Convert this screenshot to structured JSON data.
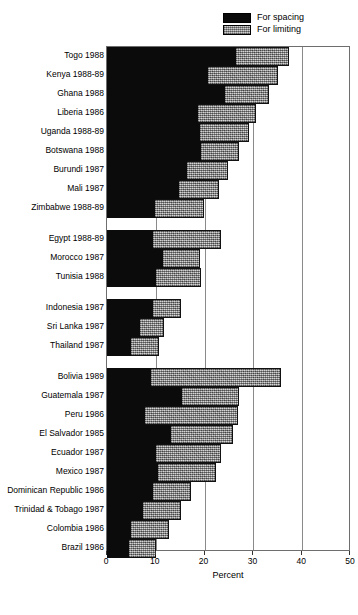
{
  "legend": {
    "items": [
      {
        "label": "For spacing",
        "swatch": "black",
        "color": "#0b0b0b"
      },
      {
        "label": "For limiting",
        "swatch": "gray",
        "color": "#a6a6a6"
      }
    ]
  },
  "axis": {
    "title": "Percent",
    "ticks": [
      0,
      10,
      20,
      30,
      40,
      50
    ],
    "tick_labels": [
      "0",
      "10",
      "20",
      "30",
      "40",
      "50"
    ]
  },
  "chart_data": {
    "type": "bar",
    "orientation": "horizontal",
    "stacked": true,
    "title": "",
    "xlabel": "Percent",
    "ylabel": "",
    "xlim": [
      0,
      50
    ],
    "grid": true,
    "legend_position": "top-right",
    "series": [
      {
        "name": "For spacing",
        "color": "#0b0b0b"
      },
      {
        "name": "For limiting",
        "color": "#a6a6a6"
      }
    ],
    "groups": [
      {
        "name": "Sub-Saharan Africa",
        "rows": [
          {
            "category": "Togo 1988",
            "spacing": 26.5,
            "limiting": 10.8,
            "total": 37.3
          },
          {
            "category": "Kenya 1988-89",
            "spacing": 20.7,
            "limiting": 14.3,
            "total": 35.0
          },
          {
            "category": "Ghana 1988",
            "spacing": 24.2,
            "limiting": 9.0,
            "total": 33.2
          },
          {
            "category": "Liberia 1986",
            "spacing": 18.6,
            "limiting": 11.9,
            "total": 30.5
          },
          {
            "category": "Uganda 1988-89",
            "spacing": 19.1,
            "limiting": 10.0,
            "total": 29.1
          },
          {
            "category": "Botswana 1988",
            "spacing": 19.3,
            "limiting": 7.8,
            "total": 27.1
          },
          {
            "category": "Burundi 1987",
            "spacing": 16.4,
            "limiting": 8.4,
            "total": 24.8
          },
          {
            "category": "Mali 1987",
            "spacing": 14.8,
            "limiting": 8.2,
            "total": 23.0
          },
          {
            "category": "Zimbabwe 1988-89",
            "spacing": 9.8,
            "limiting": 10.1,
            "total": 19.9
          }
        ]
      },
      {
        "name": "North Africa",
        "rows": [
          {
            "category": "Egypt 1988-89",
            "spacing": 9.4,
            "limiting": 14.0,
            "total": 23.4
          },
          {
            "category": "Morocco 1987",
            "spacing": 11.5,
            "limiting": 7.6,
            "total": 19.1
          },
          {
            "category": "Tunisia 1988",
            "spacing": 10.0,
            "limiting": 9.2,
            "total": 19.2
          }
        ]
      },
      {
        "name": "Asia",
        "rows": [
          {
            "category": "Indonesia 1987",
            "spacing": 9.4,
            "limiting": 5.7,
            "total": 15.1
          },
          {
            "category": "Sri Lanka 1987",
            "spacing": 6.8,
            "limiting": 4.9,
            "total": 11.7
          },
          {
            "category": "Thailand 1987",
            "spacing": 4.9,
            "limiting": 5.7,
            "total": 10.6
          }
        ]
      },
      {
        "name": "Latin America",
        "rows": [
          {
            "category": "Bolivia 1989",
            "spacing": 9.0,
            "limiting": 26.6,
            "total": 35.6
          },
          {
            "category": "Guatemala 1987",
            "spacing": 15.4,
            "limiting": 11.7,
            "total": 27.1
          },
          {
            "category": "Peru 1986",
            "spacing": 7.8,
            "limiting": 19.1,
            "total": 26.9
          },
          {
            "category": "El Salvador 1985",
            "spacing": 13.1,
            "limiting": 12.7,
            "total": 25.8
          },
          {
            "category": "Ecuador 1987",
            "spacing": 10.0,
            "limiting": 13.3,
            "total": 23.3
          },
          {
            "category": "Mexico 1987",
            "spacing": 10.4,
            "limiting": 11.9,
            "total": 22.3
          },
          {
            "category": "Dominican Republic 1986",
            "spacing": 9.4,
            "limiting": 7.8,
            "total": 17.2
          },
          {
            "category": "Trinidad & Tobago 1987",
            "spacing": 7.4,
            "limiting": 7.8,
            "total": 15.2
          },
          {
            "category": "Colombia 1986",
            "spacing": 4.9,
            "limiting": 7.8,
            "total": 12.7
          },
          {
            "category": "Brazil 1986",
            "spacing": 4.5,
            "limiting": 5.5,
            "total": 10.0
          }
        ]
      }
    ]
  }
}
